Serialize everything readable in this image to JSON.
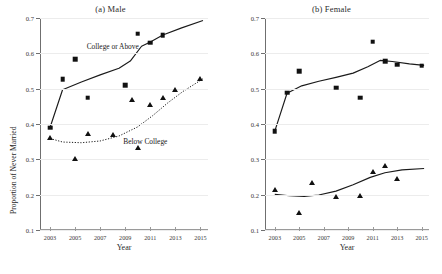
{
  "figure": {
    "xlabel": "Year",
    "ylabel": "Proportion of Never Married"
  },
  "chart_data": [
    {
      "type": "scatter",
      "title": "(a) Male",
      "xlabel": "Year",
      "ylabel": "Proportion of Never Married",
      "xlim": [
        2002.2,
        2015.6
      ],
      "ylim": [
        0.1,
        0.7
      ],
      "xticks": [
        2003,
        2005,
        2007,
        2009,
        2011,
        2013,
        2015
      ],
      "xticklabels": [
        "2003",
        "2005",
        "2007",
        "2009",
        "2011",
        "2013",
        "2015"
      ],
      "yticks": [
        0.1,
        0.2,
        0.3,
        0.4,
        0.5,
        0.6,
        0.7
      ],
      "yticklabels": [
        "0.1",
        "0.2",
        "0.3",
        "0.4",
        "0.5",
        "0.6",
        "0.7"
      ],
      "grid": true,
      "legend": "annotations",
      "annotations": [
        {
          "text": "College or Above",
          "x": 2008.0,
          "y": 0.622
        },
        {
          "text": "Below College",
          "x": 2010.6,
          "y": 0.352
        }
      ],
      "series": [
        {
          "name": "College or Above",
          "marker": "square",
          "linestyle": "solid",
          "points": [
            {
              "x": 2003.0,
              "y": 0.39
            },
            {
              "x": 2004.0,
              "y": 0.527
            },
            {
              "x": 2005.0,
              "y": 0.583
            },
            {
              "x": 2006.0,
              "y": 0.474
            },
            {
              "x": 2009.0,
              "y": 0.509
            },
            {
              "x": 2010.0,
              "y": 0.656
            },
            {
              "x": 2011.0,
              "y": 0.63
            },
            {
              "x": 2012.0,
              "y": 0.651
            }
          ],
          "fit": [
            {
              "x": 2003.0,
              "y": 0.39
            },
            {
              "x": 2004.0,
              "y": 0.497
            },
            {
              "x": 2005.5,
              "y": 0.519
            },
            {
              "x": 2007.0,
              "y": 0.539
            },
            {
              "x": 2008.5,
              "y": 0.558
            },
            {
              "x": 2009.4,
              "y": 0.578
            },
            {
              "x": 2010.3,
              "y": 0.62
            },
            {
              "x": 2011.0,
              "y": 0.632
            },
            {
              "x": 2012.0,
              "y": 0.652
            },
            {
              "x": 2013.5,
              "y": 0.672
            },
            {
              "x": 2015.2,
              "y": 0.693
            }
          ]
        },
        {
          "name": "Below College",
          "marker": "triangle",
          "linestyle": "dotted",
          "points": [
            {
              "x": 2003.0,
              "y": 0.359
            },
            {
              "x": 2005.0,
              "y": 0.3
            },
            {
              "x": 2006.0,
              "y": 0.371
            },
            {
              "x": 2008.0,
              "y": 0.37
            },
            {
              "x": 2010.0,
              "y": 0.333
            },
            {
              "x": 2009.5,
              "y": 0.467
            },
            {
              "x": 2011.0,
              "y": 0.455
            },
            {
              "x": 2012.0,
              "y": 0.473
            },
            {
              "x": 2013.0,
              "y": 0.497
            },
            {
              "x": 2015.0,
              "y": 0.527
            }
          ],
          "fit": [
            {
              "x": 2003.0,
              "y": 0.359
            },
            {
              "x": 2004.0,
              "y": 0.349
            },
            {
              "x": 2005.5,
              "y": 0.347
            },
            {
              "x": 2007.0,
              "y": 0.352
            },
            {
              "x": 2008.5,
              "y": 0.366
            },
            {
              "x": 2010.0,
              "y": 0.392
            },
            {
              "x": 2011.2,
              "y": 0.424
            },
            {
              "x": 2012.4,
              "y": 0.46
            },
            {
              "x": 2013.6,
              "y": 0.492
            },
            {
              "x": 2015.2,
              "y": 0.528
            }
          ]
        }
      ]
    },
    {
      "type": "scatter",
      "title": "(b) Female",
      "xlabel": "Year",
      "ylabel": "Proportion of Never Married",
      "xlim": [
        2002.2,
        2015.6
      ],
      "ylim": [
        0.1,
        0.7
      ],
      "xticks": [
        2003,
        2005,
        2007,
        2009,
        2011,
        2013,
        2015
      ],
      "xticklabels": [
        "2003",
        "2005",
        "2007",
        "2009",
        "2011",
        "2013",
        "2015"
      ],
      "yticks": [
        0.1,
        0.2,
        0.3,
        0.4,
        0.5,
        0.6,
        0.7
      ],
      "yticklabels": [
        "0.1",
        "0.2",
        "0.3",
        "0.4",
        "0.5",
        "0.6",
        "0.7"
      ],
      "grid": true,
      "legend": "none",
      "annotations": [],
      "series": [
        {
          "name": "College or Above",
          "marker": "square",
          "linestyle": "solid",
          "points": [
            {
              "x": 2003.0,
              "y": 0.38
            },
            {
              "x": 2004.0,
              "y": 0.489
            },
            {
              "x": 2005.0,
              "y": 0.55
            },
            {
              "x": 2008.0,
              "y": 0.503
            },
            {
              "x": 2010.0,
              "y": 0.475
            },
            {
              "x": 2011.0,
              "y": 0.633
            },
            {
              "x": 2012.0,
              "y": 0.578
            },
            {
              "x": 2013.0,
              "y": 0.568
            },
            {
              "x": 2015.0,
              "y": 0.565
            }
          ],
          "fit": [
            {
              "x": 2003.0,
              "y": 0.38
            },
            {
              "x": 2004.0,
              "y": 0.487
            },
            {
              "x": 2005.2,
              "y": 0.508
            },
            {
              "x": 2006.6,
              "y": 0.521
            },
            {
              "x": 2008.0,
              "y": 0.532
            },
            {
              "x": 2009.4,
              "y": 0.544
            },
            {
              "x": 2010.6,
              "y": 0.562
            },
            {
              "x": 2011.6,
              "y": 0.58
            },
            {
              "x": 2012.6,
              "y": 0.577
            },
            {
              "x": 2014.0,
              "y": 0.57
            },
            {
              "x": 2015.2,
              "y": 0.566
            }
          ]
        },
        {
          "name": "Below College",
          "marker": "triangle",
          "linestyle": "solid",
          "points": [
            {
              "x": 2003.0,
              "y": 0.213
            },
            {
              "x": 2005.0,
              "y": 0.148
            },
            {
              "x": 2006.0,
              "y": 0.232
            },
            {
              "x": 2008.0,
              "y": 0.194
            },
            {
              "x": 2010.0,
              "y": 0.196
            },
            {
              "x": 2011.0,
              "y": 0.265
            },
            {
              "x": 2012.0,
              "y": 0.281
            },
            {
              "x": 2013.0,
              "y": 0.245
            }
          ],
          "fit": [
            {
              "x": 2003.0,
              "y": 0.201
            },
            {
              "x": 2004.2,
              "y": 0.197
            },
            {
              "x": 2005.4,
              "y": 0.195
            },
            {
              "x": 2006.6,
              "y": 0.199
            },
            {
              "x": 2008.0,
              "y": 0.21
            },
            {
              "x": 2009.4,
              "y": 0.228
            },
            {
              "x": 2010.8,
              "y": 0.249
            },
            {
              "x": 2012.0,
              "y": 0.262
            },
            {
              "x": 2013.4,
              "y": 0.27
            },
            {
              "x": 2015.2,
              "y": 0.274
            }
          ]
        }
      ]
    }
  ]
}
